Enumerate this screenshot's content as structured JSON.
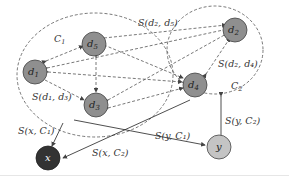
{
  "diagram": {
    "clusters": [
      {
        "id": "C1",
        "label": "C",
        "sub": "1"
      },
      {
        "id": "C2",
        "label": "C",
        "sub": "2"
      }
    ],
    "nodes": [
      {
        "id": "d1",
        "label": "d",
        "sub": "1"
      },
      {
        "id": "d5",
        "label": "d",
        "sub": "5"
      },
      {
        "id": "d3",
        "label": "d",
        "sub": "3"
      },
      {
        "id": "d2",
        "label": "d",
        "sub": "2"
      },
      {
        "id": "d4",
        "label": "d",
        "sub": "4"
      },
      {
        "id": "x",
        "label": "x"
      },
      {
        "id": "y",
        "label": "y"
      }
    ],
    "edge_labels": {
      "s_d2_d5": "S(d₂, d₅)",
      "s_d2_d4": "S(d₂, d₄)",
      "s_d1_d3": "S(d₁, d₃)",
      "s_x_c1": "S(x, C₁)",
      "s_x_c2": "S(x, C₂)",
      "s_y_c1": "S(y, C₁)",
      "s_y_c2": "S(y, C₂)"
    },
    "colors": {
      "doc_node": "#8f8f8f",
      "x_node": "#333333",
      "y_node": "#c4c4c4",
      "dashed": "#555555",
      "solid": "#222222"
    }
  }
}
